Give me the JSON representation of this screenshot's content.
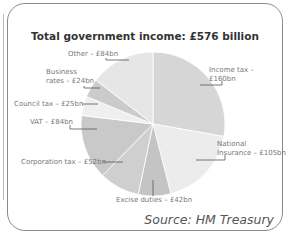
{
  "title": "Total government income: £576 billion",
  "source": "Source: HM Treasury",
  "chart_data": {
    "type": "pie",
    "title": "Total government income: £576 billion",
    "total": 576,
    "unit": "£bn",
    "slices": [
      {
        "label": "Income tax",
        "value": 160,
        "text": "Income tax – £160bn",
        "color": "#d6d6d6"
      },
      {
        "label": "National Insurance",
        "value": 105,
        "text": "National Insurance – £105bn",
        "color": "#ececec"
      },
      {
        "label": "Excise duties",
        "value": 42,
        "text": "Excise duties – £42bn",
        "color": "#c4c4c4"
      },
      {
        "label": "Corporation tax",
        "value": 52,
        "text": "Corporation tax – £52bn",
        "color": "#cfcfcf"
      },
      {
        "label": "VAT",
        "value": 84,
        "text": "VAT – £84bn",
        "color": "#c9c9c9"
      },
      {
        "label": "Council tax",
        "value": 25,
        "text": "Council tax – £25bn",
        "color": "#efefef"
      },
      {
        "label": "Business rates",
        "value": 24,
        "text": "Business rates – £24bn",
        "color": "#cbcbcb"
      },
      {
        "label": "Other",
        "value": 84,
        "text": "Other – £84bn",
        "color": "#e6e6e6"
      }
    ],
    "legend": "none (direct labels)",
    "start_angle": "12 o'clock, clockwise"
  },
  "labels": {
    "income_tax": [
      "Income tax –",
      "£160bn"
    ],
    "national_insurance": [
      "National",
      "Insurance – £105bn"
    ],
    "excise": "Excise duties – £42bn",
    "corporation": "Corporation tax – £52bn",
    "vat": "VAT – £84bn",
    "council": "Council tax – £25bn",
    "business": [
      "Business",
      "rates – £24bn"
    ],
    "other": "Other – £84bn"
  }
}
